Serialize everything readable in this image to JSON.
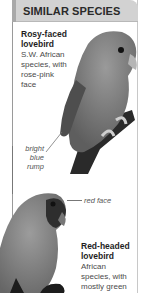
{
  "header": {
    "title": "SIMILAR SPECIES"
  },
  "species": [
    {
      "name_line1": "Rosy-faced",
      "name_line2": "lovebird",
      "desc_lines": [
        "S.W. African",
        "species, with",
        "rose-pink",
        "face"
      ],
      "annotation": [
        "bright",
        "blue",
        "rump"
      ]
    },
    {
      "name_line1": "Red-headed",
      "name_line2": "lovebird",
      "desc_lines": [
        "African",
        "species, with",
        "mostly green"
      ],
      "annotation": [
        "red face"
      ]
    }
  ],
  "colors": {
    "header_bg": "#d2d2d2",
    "border": "#9a9a9a"
  }
}
